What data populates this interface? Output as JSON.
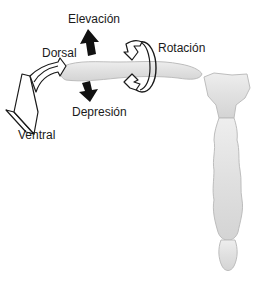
{
  "diagram": {
    "labels": {
      "elevation": "Elevación",
      "dorsal": "Dorsal",
      "rotation": "Rotación",
      "depression": "Depresión",
      "ventral": "Ventral"
    },
    "colors": {
      "bone_fill": "#e4e4e4",
      "bone_stroke": "#b9b9b9",
      "arrow_solid": "#111111",
      "arrow_outline": "#1a1a1a",
      "background": "#ffffff"
    },
    "parts": [
      "clavicle",
      "manubrium",
      "sternum-body",
      "xiphoid-process"
    ],
    "movements": [
      {
        "name": "elevation",
        "arrow": "solid-up"
      },
      {
        "name": "depression",
        "arrow": "solid-down"
      },
      {
        "name": "rotation",
        "arrow": "outline-circular"
      },
      {
        "name": "dorsal-ventral",
        "arrow": "outline-curved-3d"
      }
    ]
  }
}
